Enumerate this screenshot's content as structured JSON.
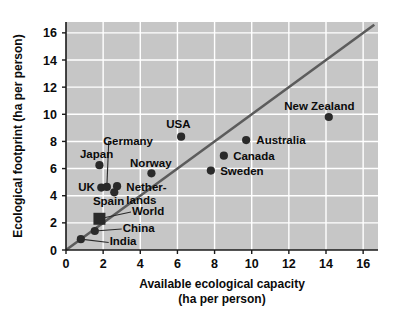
{
  "chart_data": {
    "type": "scatter",
    "title": "",
    "xlabel": "Available ecological capacity",
    "xlabel_units": "(ha per person)",
    "ylabel": "Ecological footprint (ha per person)",
    "xlim": [
      0,
      16.8
    ],
    "ylim": [
      0,
      16.8
    ],
    "xticks": [
      "0",
      "2",
      "4",
      "6",
      "8",
      "10",
      "12",
      "14",
      "16"
    ],
    "xtick_values": [
      0,
      2,
      4,
      6,
      8,
      10,
      12,
      14,
      16
    ],
    "yticks": [
      "0",
      "2",
      "4",
      "6",
      "8",
      "10",
      "12",
      "14",
      "16"
    ],
    "ytick_values": [
      0,
      2,
      4,
      6,
      8,
      10,
      12,
      14,
      16
    ],
    "grid": "white gridlines on gray panel",
    "legend": "none (points labelled directly)",
    "reference_line": {
      "name": "one-to-one line",
      "from": [
        0,
        0
      ],
      "to": [
        16.6,
        16.6
      ],
      "color": "#5a5a5a"
    },
    "points": [
      {
        "name": "India",
        "x": 0.8,
        "y": 0.8,
        "marker": "circle",
        "label_x": 2.3,
        "label_y": 0.55,
        "leader": true
      },
      {
        "name": "China",
        "x": 1.55,
        "y": 1.4,
        "marker": "circle",
        "label_x": 3.0,
        "label_y": 1.55,
        "leader": true
      },
      {
        "name": "World",
        "x": 1.8,
        "y": 2.3,
        "marker": "square",
        "label_x": 3.5,
        "label_y": 2.8,
        "leader": true
      },
      {
        "name": "Spain",
        "x": 2.6,
        "y": 4.25,
        "marker": "circle",
        "label_x": 1.55,
        "label_y": 3.5,
        "leader": false
      },
      {
        "name": "UK",
        "x": 1.9,
        "y": 4.6,
        "marker": "circle",
        "label_x": 0.55,
        "label_y": 4.45,
        "leader": false
      },
      {
        "name": "Germany",
        "x": 2.2,
        "y": 4.65,
        "marker": "circle",
        "label_x": 2.3,
        "label_y": 7.95,
        "leader": true
      },
      {
        "name": "Netherlands",
        "x": 2.75,
        "y": 4.7,
        "marker": "circle",
        "label_x": 3.4,
        "label_y": 4.5,
        "leader": false
      },
      {
        "name": "Norway",
        "x": 4.6,
        "y": 5.65,
        "marker": "circle",
        "label_x": 3.6,
        "label_y": 6.35,
        "leader": false
      },
      {
        "name": "Japan",
        "x": 1.8,
        "y": 6.25,
        "marker": "circle",
        "label_x": 0.9,
        "label_y": 6.95,
        "leader": false
      },
      {
        "name": "Sweden",
        "x": 7.8,
        "y": 5.85,
        "marker": "circle",
        "label_x": 8.35,
        "label_y": 5.7,
        "leader": false
      },
      {
        "name": "Canada",
        "x": 8.5,
        "y": 6.95,
        "marker": "circle",
        "label_x": 9.05,
        "label_y": 6.8,
        "leader": false
      },
      {
        "name": "Australia",
        "x": 9.7,
        "y": 8.1,
        "marker": "circle",
        "label_x": 10.3,
        "label_y": 7.95,
        "leader": false
      },
      {
        "name": "USA",
        "x": 6.2,
        "y": 8.35,
        "marker": "circle",
        "label_x": 5.45,
        "label_y": 9.2,
        "leader": false
      },
      {
        "name": "New Zealand",
        "x": 14.15,
        "y": 9.8,
        "marker": "circle",
        "label_x": 11.9,
        "label_y": 10.5,
        "leader": false
      }
    ]
  },
  "axes": {
    "x_title_line1": "Available ecological capacity",
    "x_title_line2": "(ha per person)",
    "y_title": "Ecological footprint (ha per person)"
  },
  "labels": {
    "india": "India",
    "china": "China",
    "world": "World",
    "spain": "Spain",
    "uk": "UK",
    "germany": "Germany",
    "netherlands_line1": "Nether-",
    "netherlands_line2": "lands",
    "norway": "Norway",
    "japan": "Japan",
    "sweden": "Sweden",
    "canada": "Canada",
    "australia": "Australia",
    "usa": "USA",
    "new_zealand": "New Zealand"
  },
  "ticks": {
    "x": [
      "0",
      "2",
      "4",
      "6",
      "8",
      "10",
      "12",
      "14",
      "16"
    ],
    "y": [
      "0",
      "2",
      "4",
      "6",
      "8",
      "10",
      "12",
      "14",
      "16"
    ]
  },
  "colors": {
    "panel": "#c6c6c6",
    "gridline": "#ffffff",
    "marker": "#2a2a2a",
    "reference_line": "#5c5c5c",
    "text": "#0b0b0b",
    "background": "#ffffff"
  }
}
